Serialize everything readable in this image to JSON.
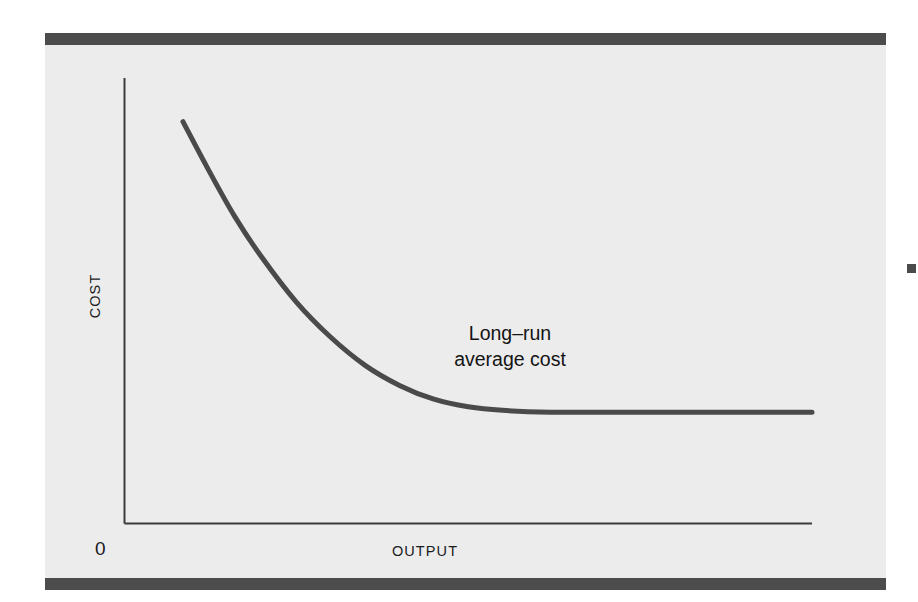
{
  "figure": {
    "panel_bg": "#ececed",
    "rule_color": "#4c4c4c",
    "page_bg": "#ffffff"
  },
  "axes": {
    "y_label": "COST",
    "x_label": "OUTPUT",
    "origin_label": "0",
    "axis_color": "#3a3a3a"
  },
  "annotation": {
    "line1": "Long–run",
    "line2": "average cost"
  },
  "chart_data": {
    "type": "line",
    "title": "",
    "subtitle": "",
    "xlabel": "OUTPUT",
    "ylabel": "COST",
    "origin_label": "0",
    "grid": false,
    "legend": false,
    "legend_position": "none",
    "axis_ranges": {
      "x": [
        0,
        1
      ],
      "y": [
        0,
        1
      ]
    },
    "annotations": [
      {
        "text": "Long–run average cost",
        "lines": [
          "Long–run",
          "average cost"
        ],
        "x": 0.56,
        "y": 0.42
      }
    ],
    "series": [
      {
        "name": "Long-run average cost",
        "color": "#4a4a4a",
        "line_width": 5,
        "x": [
          0.085,
          0.12,
          0.16,
          0.2,
          0.25,
          0.3,
          0.35,
          0.4,
          0.45,
          0.5,
          0.55,
          0.62,
          0.7,
          0.8,
          0.9,
          1.0
        ],
        "y": [
          0.902,
          0.8,
          0.69,
          0.597,
          0.497,
          0.418,
          0.355,
          0.31,
          0.279,
          0.262,
          0.254,
          0.25,
          0.25,
          0.25,
          0.25,
          0.25
        ],
        "description": "Falling convex long-run average cost curve that flattens to a horizontal asymptote at constant returns to scale"
      }
    ],
    "curve_pixels": {
      "start": [
        182,
        122
      ],
      "asymptote_y": 379,
      "end": [
        810,
        379
      ],
      "flatten_x": 440
    }
  },
  "marks": {
    "edge_mark_color": "#4a4a4a"
  }
}
